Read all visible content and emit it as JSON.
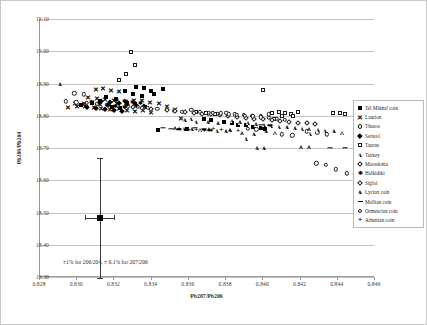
{
  "chart_data": {
    "type": "scatter",
    "title": "",
    "xlabel": "Pb207/Pb206",
    "ylabel": "Pb206/Pb204",
    "xlim": [
      0.828,
      0.846
    ],
    "ylim": [
      18.3,
      19.1
    ],
    "xticks": [
      "0.828",
      "0.830",
      "0.832",
      "0.834",
      "0.836",
      "0.838",
      "0.840",
      "0.842",
      "0.844",
      "0.846"
    ],
    "yticks": [
      "18.30",
      "18.40",
      "18.50",
      "18.60",
      "18.70",
      "18.80",
      "18.90",
      "19.00",
      "19.10"
    ],
    "grid": "horizontal",
    "legend_position": "right",
    "annotation": "±1% for 206/204, ± 0.1% for 207/206",
    "error_bar": {
      "x": 0.8312,
      "y": 18.483,
      "x_error": 0.0008,
      "y_error": 0.185,
      "marker": "square-filled"
    },
    "series": [
      {
        "name": "Tel Mikhal coin",
        "marker": "square-filled",
        "points": [
          [
            0.83255,
            18.878
          ],
          [
            0.83318,
            18.889
          ],
          [
            0.8336,
            18.886
          ],
          [
            0.83395,
            18.877
          ],
          [
            0.833,
            18.866
          ],
          [
            0.83348,
            18.862
          ],
          [
            0.83415,
            18.868
          ],
          [
            0.83462,
            18.884
          ],
          [
            0.8321,
            18.852
          ],
          [
            0.83155,
            18.858
          ],
          [
            0.8312,
            18.845
          ],
          [
            0.8308,
            18.838
          ],
          [
            0.8302,
            18.833
          ],
          [
            0.83268,
            18.841
          ],
          [
            0.8331,
            18.836
          ],
          [
            0.83365,
            18.828
          ],
          [
            0.8323,
            18.823
          ],
          [
            0.83185,
            18.826
          ],
          [
            0.83435,
            18.757
          ],
          [
            0.83592,
            18.758
          ],
          [
            0.8368,
            18.789
          ],
          [
            0.8372,
            18.786
          ],
          [
            0.8379,
            18.782
          ],
          [
            0.8383,
            18.777
          ],
          [
            0.83862,
            18.772
          ],
          [
            0.83905,
            18.77
          ],
          [
            0.83945,
            18.765
          ],
          [
            0.83985,
            18.763
          ],
          [
            0.8401,
            18.76
          ]
        ]
      },
      {
        "name": "Laurion",
        "marker": "x",
        "points": [
          [
            0.831,
            18.884
          ],
          [
            0.8314,
            18.886
          ],
          [
            0.83182,
            18.88
          ],
          [
            0.83225,
            18.877
          ],
          [
            0.8306,
            18.857
          ],
          [
            0.83105,
            18.855
          ],
          [
            0.83148,
            18.851
          ],
          [
            0.83195,
            18.849
          ],
          [
            0.8299,
            18.838
          ],
          [
            0.83035,
            18.84
          ],
          [
            0.83078,
            18.843
          ],
          [
            0.83125,
            18.836
          ],
          [
            0.8317,
            18.834
          ],
          [
            0.83215,
            18.838
          ],
          [
            0.8326,
            18.846
          ],
          [
            0.83305,
            18.85
          ],
          [
            0.8335,
            18.848
          ],
          [
            0.83392,
            18.843
          ],
          [
            0.8344,
            18.838
          ],
          [
            0.8295,
            18.826
          ],
          [
            0.82998,
            18.829
          ],
          [
            0.83042,
            18.831
          ],
          [
            0.83088,
            18.827
          ],
          [
            0.8313,
            18.824
          ],
          [
            0.83178,
            18.82
          ],
          [
            0.83222,
            18.823
          ],
          [
            0.83268,
            18.817
          ],
          [
            0.8331,
            18.814
          ],
          [
            0.83355,
            18.818
          ],
          [
            0.83398,
            18.812
          ],
          [
            0.8348,
            18.83
          ],
          [
            0.83525,
            18.822
          ],
          [
            0.8356,
            18.792
          ]
        ]
      },
      {
        "name": "Thasos",
        "marker": "circle-open",
        "points": [
          [
            0.82985,
            18.87
          ],
          [
            0.83035,
            18.866
          ],
          [
            0.8294,
            18.845
          ],
          [
            0.82995,
            18.842
          ],
          [
            0.83052,
            18.84
          ],
          [
            0.83108,
            18.837
          ],
          [
            0.83162,
            18.834
          ],
          [
            0.83218,
            18.832
          ],
          [
            0.83272,
            18.829
          ],
          [
            0.83325,
            18.827
          ],
          [
            0.8338,
            18.825
          ],
          [
            0.8343,
            18.822
          ],
          [
            0.8348,
            18.819
          ],
          [
            0.83522,
            18.816
          ],
          [
            0.83565,
            18.813
          ],
          [
            0.83612,
            18.818
          ],
          [
            0.83658,
            18.812
          ],
          [
            0.83705,
            18.808
          ],
          [
            0.83752,
            18.806
          ],
          [
            0.838,
            18.809
          ],
          [
            0.83848,
            18.805
          ],
          [
            0.83895,
            18.803
          ],
          [
            0.8394,
            18.8
          ],
          [
            0.83985,
            18.798
          ],
          [
            0.84028,
            18.804
          ],
          [
            0.84235,
            18.752
          ],
          [
            0.8429,
            18.747
          ],
          [
            0.8434,
            18.742
          ],
          [
            0.841,
            18.742
          ],
          [
            0.84155,
            18.739
          ]
        ]
      },
      {
        "name": "Series1",
        "marker": "diamond-filled",
        "points": [
          [
            0.83128,
            18.847
          ],
          [
            0.83176,
            18.843
          ],
          [
            0.83222,
            18.839
          ],
          [
            0.83268,
            18.836
          ],
          [
            0.83315,
            18.833
          ],
          [
            0.8336,
            18.83
          ],
          [
            0.83055,
            18.828
          ],
          [
            0.83102,
            18.825
          ],
          [
            0.83148,
            18.822
          ],
          [
            0.83195,
            18.819
          ],
          [
            0.83242,
            18.816
          ]
        ]
      },
      {
        "name": "Taurus",
        "marker": "square-open",
        "points": [
          [
            0.8329,
            18.998
          ],
          [
            0.8331,
            18.958
          ],
          [
            0.83262,
            18.93
          ],
          [
            0.83225,
            18.912
          ],
          [
            0.8364,
            18.812
          ],
          [
            0.8369,
            18.808
          ],
          [
            0.8374,
            18.805
          ],
          [
            0.83998,
            18.88
          ],
          [
            0.84045,
            18.808
          ],
          [
            0.84082,
            18.812
          ],
          [
            0.84118,
            18.808
          ],
          [
            0.8415,
            18.806
          ],
          [
            0.84185,
            18.812
          ],
          [
            0.841,
            18.798
          ],
          [
            0.84055,
            18.79
          ],
          [
            0.84158,
            18.798
          ],
          [
            0.84375,
            18.808
          ],
          [
            0.84412,
            18.81
          ],
          [
            0.8444,
            18.806
          ]
        ]
      },
      {
        "name": "Turkey",
        "marker": "triangle-open",
        "points": [
          [
            0.82905,
            18.898
          ],
          [
            0.8358,
            18.786
          ],
          [
            0.8364,
            18.782
          ],
          [
            0.837,
            18.78
          ],
          [
            0.83755,
            18.776
          ],
          [
            0.8383,
            18.784
          ],
          [
            0.83875,
            18.78
          ],
          [
            0.83918,
            18.778
          ],
          [
            0.83962,
            18.774
          ],
          [
            0.84005,
            18.772
          ],
          [
            0.84042,
            18.769
          ],
          [
            0.84085,
            18.766
          ],
          [
            0.84125,
            18.764
          ],
          [
            0.84168,
            18.762
          ],
          [
            0.84208,
            18.76
          ],
          [
            0.84248,
            18.758
          ],
          [
            0.84292,
            18.756
          ],
          [
            0.84332,
            18.754
          ],
          [
            0.8438,
            18.752
          ],
          [
            0.84425,
            18.748
          ],
          [
            0.83888,
            18.746
          ],
          [
            0.8395,
            18.742
          ],
          [
            0.84012,
            18.752
          ],
          [
            0.84065,
            18.748
          ],
          [
            0.83965,
            18.7
          ],
          [
            0.84005,
            18.7
          ],
          [
            0.8382,
            18.755
          ],
          [
            0.83612,
            18.79
          ],
          [
            0.84252,
            18.744
          ]
        ]
      },
      {
        "name": "Macedonia",
        "marker": "diamond-open",
        "points": [
          [
            0.8348,
            18.818
          ],
          [
            0.83528,
            18.815
          ],
          [
            0.83578,
            18.812
          ],
          [
            0.83625,
            18.809
          ],
          [
            0.83672,
            18.806
          ],
          [
            0.83718,
            18.804
          ],
          [
            0.83765,
            18.801
          ],
          [
            0.83812,
            18.799
          ],
          [
            0.83858,
            18.796
          ],
          [
            0.83905,
            18.794
          ],
          [
            0.83952,
            18.791
          ],
          [
            0.83998,
            18.789
          ],
          [
            0.84045,
            18.786
          ],
          [
            0.84092,
            18.784
          ],
          [
            0.84138,
            18.782
          ],
          [
            0.84185,
            18.779
          ],
          [
            0.84232,
            18.777
          ],
          [
            0.84278,
            18.774
          ],
          [
            0.83398,
            18.821
          ],
          [
            0.83348,
            18.824
          ],
          [
            0.83298,
            18.827
          ]
        ]
      },
      {
        "name": "Halkidiki",
        "marker": "star",
        "points": [
          [
            0.8321,
            18.848
          ],
          [
            0.83255,
            18.845
          ],
          [
            0.83298,
            18.842
          ],
          [
            0.83342,
            18.839
          ],
          [
            0.83165,
            18.834
          ],
          [
            0.83208,
            18.831
          ],
          [
            0.83252,
            18.828
          ],
          [
            0.83118,
            18.838
          ],
          [
            0.83075,
            18.842
          ]
        ]
      },
      {
        "name": "Sigloi",
        "marker": "circle-open",
        "points": [
          [
            0.83858,
            18.802
          ],
          [
            0.83902,
            18.8
          ],
          [
            0.83945,
            18.798
          ],
          [
            0.83988,
            18.795
          ],
          [
            0.8403,
            18.793
          ],
          [
            0.84072,
            18.791
          ],
          [
            0.84115,
            18.788
          ],
          [
            0.83815,
            18.805
          ],
          [
            0.83772,
            18.807
          ],
          [
            0.83728,
            18.81
          ]
        ]
      },
      {
        "name": "Lycian coin",
        "marker": "triangle-open",
        "points": [
          [
            0.83528,
            18.762
          ],
          [
            0.83572,
            18.76
          ],
          [
            0.83618,
            18.758
          ],
          [
            0.83662,
            18.756
          ],
          [
            0.83708,
            18.758
          ],
          [
            0.83752,
            18.754
          ],
          [
            0.83798,
            18.752
          ],
          [
            0.83905,
            18.728
          ],
          [
            0.84205,
            18.702
          ],
          [
            0.84248,
            18.702
          ]
        ]
      },
      {
        "name": "Mallian coin",
        "marker": "dash",
        "points": [
          [
            0.83462,
            18.762
          ],
          [
            0.83505,
            18.76
          ],
          [
            0.83548,
            18.758
          ],
          [
            0.83592,
            18.756
          ],
          [
            0.83635,
            18.762
          ],
          [
            0.8368,
            18.758
          ],
          [
            0.83985,
            18.772
          ],
          [
            0.84038,
            18.77
          ],
          [
            0.84358,
            18.7
          ],
          [
            0.8444,
            18.7
          ],
          [
            0.83715,
            18.755
          ]
        ]
      },
      {
        "name": "Ormescian coin",
        "marker": "circle-open",
        "points": [
          [
            0.84285,
            18.652
          ],
          [
            0.84335,
            18.648
          ],
          [
            0.8445,
            18.622
          ],
          [
            0.8449,
            18.618
          ],
          [
            0.84388,
            18.634
          ],
          [
            0.83918,
            18.76
          ],
          [
            0.83962,
            18.758
          ]
        ]
      },
      {
        "name": "Athenian coin",
        "marker": "plus",
        "points": [
          [
            0.83598,
            18.757
          ],
          [
            0.8364,
            18.755
          ],
          [
            0.83685,
            18.753
          ],
          [
            0.8373,
            18.758
          ],
          [
            0.83775,
            18.756
          ],
          [
            0.83822,
            18.754
          ],
          [
            0.83865,
            18.752
          ],
          [
            0.83548,
            18.76
          ]
        ]
      }
    ],
    "legend": [
      {
        "label": "Tel Mikhal coin",
        "marker": "square-filled"
      },
      {
        "label": "Laurion",
        "marker": "x"
      },
      {
        "label": "Thasos",
        "marker": "circle-open"
      },
      {
        "label": "Series1",
        "marker": "diamond-filled"
      },
      {
        "label": "Taurus",
        "marker": "square-open"
      },
      {
        "label": "Turkey",
        "marker": "triangle-open"
      },
      {
        "label": "Macedonia",
        "marker": "diamond-open"
      },
      {
        "label": "Halkidiki",
        "marker": "star"
      },
      {
        "label": "Sigloi",
        "marker": "diamond-open"
      },
      {
        "label": "Lycian coin",
        "marker": "triangle-open"
      },
      {
        "label": "Mallian coin",
        "marker": "dash"
      },
      {
        "label": "Ormescian coin",
        "marker": "circle-open"
      },
      {
        "label": "Athenian coin",
        "marker": "plus"
      }
    ]
  }
}
